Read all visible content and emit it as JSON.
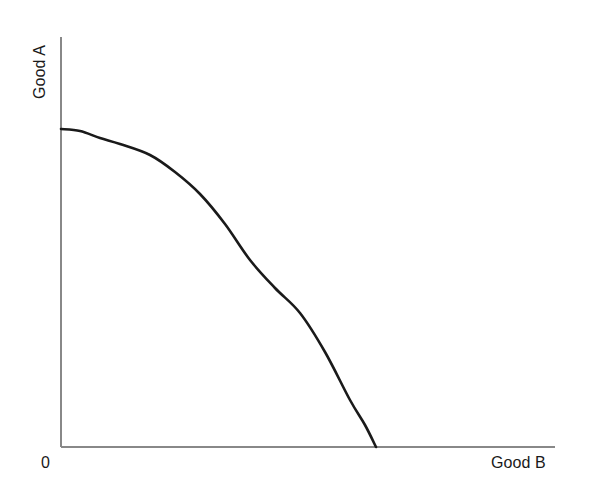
{
  "figure": {
    "background_color": "#ffffff",
    "width": 597,
    "height": 497
  },
  "axes": {
    "y_axis_label": "Good A",
    "x_axis_label": "Good B",
    "origin_label": "0",
    "axis_color": "#888888",
    "axis_line_width": 1.2
  },
  "curve": {
    "name": "Production Possibilities Frontier",
    "color": "#1a1a1a",
    "line_width": 2.6
  },
  "chart_data": {
    "type": "line",
    "title": "",
    "subtitle": "",
    "xlabel": "Good B",
    "ylabel": "Good A",
    "grid": false,
    "legend": false,
    "legend_position": "none",
    "xlim": [
      0,
      1.56
    ],
    "ylim": [
      0,
      1.19
    ],
    "x_tick_labels": [
      "0"
    ],
    "y_tick_labels": [],
    "annotations": [
      "0"
    ],
    "series": [
      {
        "name": "Production Possibilities Frontier",
        "color": "#1a1a1a",
        "x": [
          0.0,
          0.1,
          0.2,
          0.3,
          0.4,
          0.5,
          0.6,
          0.7,
          0.8,
          0.9,
          1.0
        ],
        "y": [
          1.0,
          0.995,
          0.978,
          0.948,
          0.903,
          0.841,
          0.757,
          0.648,
          0.505,
          0.309,
          0.0
        ],
        "description": "Concave-to-origin production possibilities frontier from the Good A intercept to the Good B intercept"
      }
    ],
    "curve_pixel_points": [
      [
        61,
        129
      ],
      [
        80,
        131
      ],
      [
        100,
        138
      ],
      [
        120,
        144
      ],
      [
        150,
        155
      ],
      [
        175,
        172
      ],
      [
        200,
        194
      ],
      [
        225,
        224
      ],
      [
        250,
        260
      ],
      [
        275,
        288
      ],
      [
        300,
        313
      ],
      [
        325,
        352
      ],
      [
        350,
        400
      ],
      [
        365,
        425
      ],
      [
        376,
        447
      ]
    ],
    "axis_pixels": {
      "y_axis_x": 61,
      "y_axis_top": 37,
      "y_axis_bottom": 447,
      "x_axis_y": 447,
      "x_axis_left": 61,
      "x_axis_right": 555
    }
  }
}
